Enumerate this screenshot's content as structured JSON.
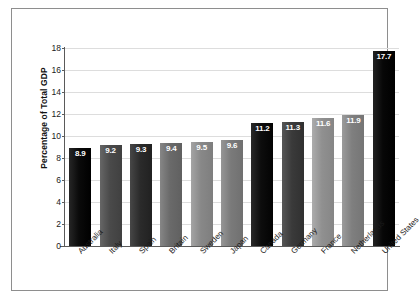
{
  "chart_data": {
    "type": "bar",
    "title": "",
    "xlabel": "",
    "ylabel": "Percentage of Total GDP",
    "ylim": [
      0,
      18
    ],
    "yticks": [
      0,
      2,
      4,
      6,
      8,
      10,
      12,
      14,
      16,
      18
    ],
    "grid": true,
    "legend": "none",
    "categories": [
      "Australia",
      "Italy",
      "Spain",
      "Britain",
      "Sweden",
      "Japan",
      "Canada",
      "Germany",
      "France",
      "Netherlands",
      "United States"
    ],
    "values": [
      8.9,
      9.2,
      9.3,
      9.4,
      9.5,
      9.6,
      11.2,
      11.3,
      11.6,
      11.9,
      17.7
    ],
    "value_labels": [
      "8.9",
      "9.2",
      "9.3",
      "9.4",
      "9.5",
      "9.6",
      "11.2",
      "11.3",
      "11.6",
      "11.9",
      "17.7"
    ],
    "bar_colors": [
      "#0a0a0a",
      "#4a4a4a",
      "#2b2b2b",
      "#6a6a6a",
      "#888888",
      "#7a7a7a",
      "#0d0d0d",
      "#3a3a3a",
      "#909090",
      "#7f7f7f",
      "#070707"
    ],
    "ytick_labels": [
      "0",
      "2",
      "4",
      "6",
      "8",
      "10",
      "12",
      "14",
      "16",
      "18"
    ]
  },
  "figure": {
    "frame_color": "#8e8e8e",
    "axis_color": "#5a5a5a",
    "grid_color": "#dddddd",
    "background": "#ffffff"
  }
}
